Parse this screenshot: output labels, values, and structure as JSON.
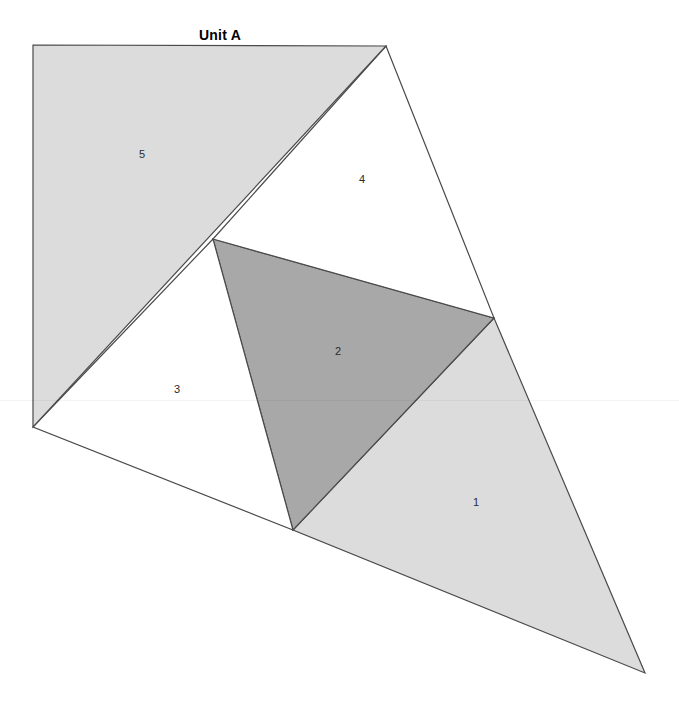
{
  "title": "Unit A",
  "canvas": {
    "width": 679,
    "height": 719,
    "background": "#ffffff"
  },
  "style": {
    "stroke": "#4a4a4a",
    "stroke_width": 1.2,
    "fill_light": "#dcdcdc",
    "fill_medium": "#a8a8a8",
    "fill_white": "#ffffff",
    "label_color": "#2b2b2b"
  },
  "chart_data": {
    "type": "diagram",
    "title": "Unit A",
    "vertices": {
      "top_left": [
        33,
        45
      ],
      "apex": [
        386,
        46
      ],
      "center": [
        213,
        239
      ],
      "right": [
        494,
        318
      ],
      "left": [
        33,
        427
      ],
      "bottom_center": [
        293,
        530
      ],
      "bottom_right": [
        645,
        673
      ]
    },
    "regions": [
      {
        "label": "1",
        "fill": "#dcdcdc",
        "shade": "light",
        "points": "293,530 494,318 645,673",
        "label_x": 476,
        "label_y": 503
      },
      {
        "label": "2",
        "fill": "#a8a8a8",
        "shade": "medium",
        "points": "213,239 494,318 293,530",
        "label_x": 338,
        "label_y": 352
      },
      {
        "label": "3",
        "fill": "#ffffff",
        "shade": "white",
        "points": "33,427 213,239 293,530",
        "label_x": 177,
        "label_y": 390
      },
      {
        "label": "4",
        "fill": "#ffffff",
        "shade": "white",
        "points": "386,46 494,318 213,239",
        "label_x": 362,
        "label_y": 180
      },
      {
        "label": "5",
        "fill": "#dcdcdc",
        "shade": "light",
        "points": "33,45 386,46 33,427",
        "label_x": 142,
        "label_y": 155
      }
    ]
  }
}
